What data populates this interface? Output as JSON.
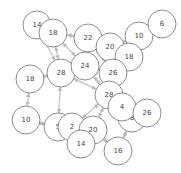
{
  "diagram": {
    "type": "network-graph",
    "node_color": "#ffffff",
    "node_stroke": "#6e6e6e",
    "edge_color": "#c8c8c8",
    "nodes": [
      {
        "id": "n1",
        "label": "14",
        "x": 37,
        "y": 25,
        "r": 14
      },
      {
        "id": "n2",
        "label": "18",
        "x": 53,
        "y": 33,
        "r": 14
      },
      {
        "id": "n3",
        "label": "22",
        "x": 88,
        "y": 38,
        "r": 14
      },
      {
        "id": "n4",
        "label": "10",
        "x": 139,
        "y": 36,
        "r": 14
      },
      {
        "id": "n5",
        "label": "6",
        "x": 162,
        "y": 24,
        "r": 14
      },
      {
        "id": "n6",
        "label": "20",
        "x": 110,
        "y": 47,
        "r": 14
      },
      {
        "id": "n7",
        "label": "18",
        "x": 129,
        "y": 57,
        "r": 14
      },
      {
        "id": "n8",
        "label": "18",
        "x": 30,
        "y": 79,
        "r": 14
      },
      {
        "id": "n9",
        "label": "28",
        "x": 61,
        "y": 73,
        "r": 14
      },
      {
        "id": "n10",
        "label": "24",
        "x": 85,
        "y": 66,
        "r": 14
      },
      {
        "id": "n11",
        "label": "26",
        "x": 113,
        "y": 73,
        "r": 14
      },
      {
        "id": "n12",
        "label": "28",
        "x": 109,
        "y": 95,
        "r": 14
      },
      {
        "id": "n13",
        "label": "10",
        "x": 26,
        "y": 120,
        "r": 14
      },
      {
        "id": "n14",
        "label": "5",
        "x": 58,
        "y": 127,
        "r": 14
      },
      {
        "id": "n15",
        "label": "2",
        "x": 72,
        "y": 127,
        "r": 14
      },
      {
        "id": "n16",
        "label": "20",
        "x": 93,
        "y": 130,
        "r": 14
      },
      {
        "id": "n17",
        "label": "14",
        "x": 81,
        "y": 144,
        "r": 14
      },
      {
        "id": "n18",
        "label": "8",
        "x": 132,
        "y": 118,
        "r": 14
      },
      {
        "id": "n19",
        "label": "4",
        "x": 122,
        "y": 107,
        "r": 14
      },
      {
        "id": "n20",
        "label": "26",
        "x": 147,
        "y": 113,
        "r": 14
      },
      {
        "id": "n21",
        "label": "16",
        "x": 118,
        "y": 151,
        "r": 14
      }
    ],
    "edges": [
      [
        "n1",
        "n2"
      ],
      [
        "n2",
        "n3"
      ],
      [
        "n2",
        "n9"
      ],
      [
        "n2",
        "n10"
      ],
      [
        "n3",
        "n6"
      ],
      [
        "n3",
        "n10"
      ],
      [
        "n4",
        "n5"
      ],
      [
        "n4",
        "n6"
      ],
      [
        "n4",
        "n7"
      ],
      [
        "n6",
        "n7"
      ],
      [
        "n6",
        "n11"
      ],
      [
        "n7",
        "n11"
      ],
      [
        "n8",
        "n9"
      ],
      [
        "n8",
        "n13"
      ],
      [
        "n9",
        "n10"
      ],
      [
        "n9",
        "n14"
      ],
      [
        "n9",
        "n12"
      ],
      [
        "n10",
        "n11"
      ],
      [
        "n10",
        "n12"
      ],
      [
        "n11",
        "n12"
      ],
      [
        "n12",
        "n19"
      ],
      [
        "n12",
        "n16"
      ],
      [
        "n13",
        "n14"
      ],
      [
        "n14",
        "n15"
      ],
      [
        "n15",
        "n16"
      ],
      [
        "n15",
        "n17"
      ],
      [
        "n16",
        "n17"
      ],
      [
        "n16",
        "n21"
      ],
      [
        "n19",
        "n20"
      ],
      [
        "n18",
        "n20"
      ],
      [
        "n18",
        "n21"
      ],
      [
        "n19",
        "n18"
      ],
      [
        "n12",
        "n15"
      ],
      [
        "n1",
        "n9"
      ],
      [
        "n3",
        "n11"
      ]
    ]
  }
}
